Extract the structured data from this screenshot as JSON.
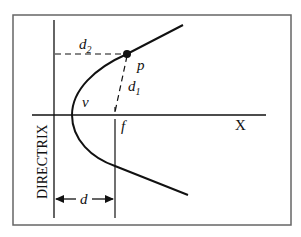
{
  "caption_fragment": "…",
  "diagram": {
    "labels": {
      "d2": "d",
      "d2_sub": "2",
      "d1": "d",
      "d1_sub": "1",
      "point": "p",
      "vertex": "v",
      "focus": "f",
      "axis": "X",
      "directrix": "DIRECTRIX",
      "distance": "d"
    },
    "colors": {
      "stroke": "#111111",
      "frame": "#666666",
      "background": "#ffffff"
    }
  }
}
